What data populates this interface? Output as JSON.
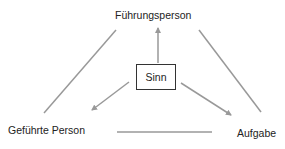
{
  "diagram": {
    "nodes": {
      "top": "Führungsperson",
      "left": "Geführte Person",
      "right": "Aufgabe",
      "center": "Sinn"
    },
    "edges": [
      {
        "from": "Führungsperson",
        "to": "Geführte Person",
        "type": "line"
      },
      {
        "from": "Führungsperson",
        "to": "Aufgabe",
        "type": "line"
      },
      {
        "from": "Geführte Person",
        "to": "Aufgabe",
        "type": "line"
      },
      {
        "from": "Sinn",
        "to": "Führungsperson",
        "type": "arrow"
      },
      {
        "from": "Sinn",
        "to": "Geführte Person",
        "type": "arrow"
      },
      {
        "from": "Sinn",
        "to": "Aufgabe",
        "type": "arrow"
      }
    ],
    "colors": {
      "line": "#999999",
      "box_border": "#333333",
      "text": "#222222"
    }
  }
}
